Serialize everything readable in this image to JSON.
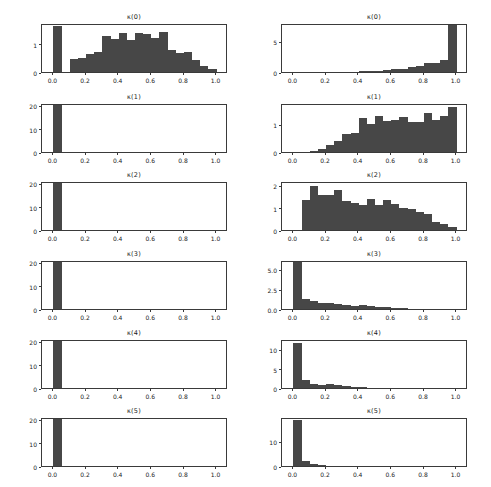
{
  "figure": {
    "background": "#ffffff",
    "bar_color": "#474747",
    "axis_color": "#3a3a3a",
    "rows": 6,
    "columns": 2
  },
  "chart_data": [
    {
      "type": "bar",
      "title": "κ(0)",
      "panel": "left-row-1",
      "xlabel": "",
      "ylabel": "",
      "xlim": [
        -0.07,
        1.07
      ],
      "ylim": [
        0,
        1.72
      ],
      "xticks": [
        0.0,
        0.2,
        0.4,
        0.6,
        0.8,
        1.0
      ],
      "xtick_labels": [
        "0.0",
        "0.2",
        "0.4",
        "0.6",
        "0.8",
        "1.0"
      ],
      "yticks": [
        0,
        1
      ],
      "ytick_labels": [
        "0",
        "1"
      ],
      "grid": false,
      "bin_edges": [
        0.0,
        0.05,
        0.1,
        0.15,
        0.2,
        0.25,
        0.3,
        0.35,
        0.4,
        0.45,
        0.5,
        0.55,
        0.6,
        0.65,
        0.7,
        0.75,
        0.8,
        0.85,
        0.9,
        0.95,
        1.0
      ],
      "values": [
        1.62,
        0.0,
        0.45,
        0.5,
        0.62,
        0.72,
        1.28,
        1.15,
        1.38,
        1.12,
        1.38,
        1.32,
        1.18,
        1.4,
        0.78,
        0.68,
        0.7,
        0.42,
        0.22,
        0.12
      ]
    },
    {
      "type": "bar",
      "title": "κ(1)",
      "panel": "left-row-2",
      "xlabel": "",
      "ylabel": "",
      "xlim": [
        -0.07,
        1.07
      ],
      "ylim": [
        0,
        21
      ],
      "xticks": [
        0.0,
        0.2,
        0.4,
        0.6,
        0.8,
        1.0
      ],
      "xtick_labels": [
        "0.0",
        "0.2",
        "0.4",
        "0.6",
        "0.8",
        "1.0"
      ],
      "yticks": [
        0,
        10,
        20
      ],
      "ytick_labels": [
        "0",
        "10",
        "20"
      ],
      "grid": false,
      "bin_edges": [
        0.0,
        0.05,
        0.1,
        0.15,
        0.2,
        0.25,
        0.3,
        0.35,
        0.4,
        0.45,
        0.5,
        0.55,
        0.6,
        0.65,
        0.7,
        0.75,
        0.8,
        0.85,
        0.9,
        0.95,
        1.0
      ],
      "values": [
        20.0,
        0,
        0,
        0,
        0,
        0,
        0,
        0,
        0,
        0,
        0,
        0,
        0,
        0,
        0,
        0,
        0,
        0,
        0,
        0
      ]
    },
    {
      "type": "bar",
      "title": "κ(2)",
      "panel": "left-row-3",
      "xlabel": "",
      "ylabel": "",
      "xlim": [
        -0.07,
        1.07
      ],
      "ylim": [
        0,
        21
      ],
      "xticks": [
        0.0,
        0.2,
        0.4,
        0.6,
        0.8,
        1.0
      ],
      "xtick_labels": [
        "0.0",
        "0.2",
        "0.4",
        "0.6",
        "0.8",
        "1.0"
      ],
      "yticks": [
        0,
        10,
        20
      ],
      "ytick_labels": [
        "0",
        "10",
        "20"
      ],
      "grid": false,
      "bin_edges": [
        0.0,
        0.05,
        0.1,
        0.15,
        0.2,
        0.25,
        0.3,
        0.35,
        0.4,
        0.45,
        0.5,
        0.55,
        0.6,
        0.65,
        0.7,
        0.75,
        0.8,
        0.85,
        0.9,
        0.95,
        1.0
      ],
      "values": [
        20.0,
        0,
        0,
        0,
        0,
        0,
        0,
        0,
        0,
        0,
        0,
        0,
        0,
        0,
        0,
        0,
        0,
        0,
        0,
        0
      ]
    },
    {
      "type": "bar",
      "title": "κ(3)",
      "panel": "left-row-4",
      "xlabel": "",
      "ylabel": "",
      "xlim": [
        -0.07,
        1.07
      ],
      "ylim": [
        0,
        21
      ],
      "xticks": [
        0.0,
        0.2,
        0.4,
        0.6,
        0.8,
        1.0
      ],
      "xtick_labels": [
        "0.0",
        "0.2",
        "0.4",
        "0.6",
        "0.8",
        "1.0"
      ],
      "yticks": [
        0,
        10,
        20
      ],
      "ytick_labels": [
        "0",
        "10",
        "20"
      ],
      "grid": false,
      "bin_edges": [
        0.0,
        0.05,
        0.1,
        0.15,
        0.2,
        0.25,
        0.3,
        0.35,
        0.4,
        0.45,
        0.5,
        0.55,
        0.6,
        0.65,
        0.7,
        0.75,
        0.8,
        0.85,
        0.9,
        0.95,
        1.0
      ],
      "values": [
        20.0,
        0,
        0,
        0,
        0,
        0,
        0,
        0,
        0,
        0,
        0,
        0,
        0,
        0,
        0,
        0,
        0,
        0,
        0,
        0
      ]
    },
    {
      "type": "bar",
      "title": "κ(4)",
      "panel": "left-row-5",
      "xlabel": "",
      "ylabel": "",
      "xlim": [
        -0.07,
        1.07
      ],
      "ylim": [
        0,
        21
      ],
      "xticks": [
        0.0,
        0.2,
        0.4,
        0.6,
        0.8,
        1.0
      ],
      "xtick_labels": [
        "0.0",
        "0.2",
        "0.4",
        "0.6",
        "0.8",
        "1.0"
      ],
      "yticks": [
        0,
        10,
        20
      ],
      "ytick_labels": [
        "0",
        "10",
        "20"
      ],
      "grid": false,
      "bin_edges": [
        0.0,
        0.05,
        0.1,
        0.15,
        0.2,
        0.25,
        0.3,
        0.35,
        0.4,
        0.45,
        0.5,
        0.55,
        0.6,
        0.65,
        0.7,
        0.75,
        0.8,
        0.85,
        0.9,
        0.95,
        1.0
      ],
      "values": [
        20.0,
        0,
        0,
        0,
        0,
        0,
        0,
        0,
        0,
        0,
        0,
        0,
        0,
        0,
        0,
        0,
        0,
        0,
        0,
        0
      ]
    },
    {
      "type": "bar",
      "title": "κ(5)",
      "panel": "left-row-6",
      "xlabel": "",
      "ylabel": "",
      "xlim": [
        -0.07,
        1.07
      ],
      "ylim": [
        0,
        21
      ],
      "xticks": [
        0.0,
        0.2,
        0.4,
        0.6,
        0.8,
        1.0
      ],
      "xtick_labels": [
        "0.0",
        "0.2",
        "0.4",
        "0.6",
        "0.8",
        "1.0"
      ],
      "yticks": [
        0,
        10,
        20
      ],
      "ytick_labels": [
        "0",
        "10",
        "20"
      ],
      "grid": false,
      "bin_edges": [
        0.0,
        0.05,
        0.1,
        0.15,
        0.2,
        0.25,
        0.3,
        0.35,
        0.4,
        0.45,
        0.5,
        0.55,
        0.6,
        0.65,
        0.7,
        0.75,
        0.8,
        0.85,
        0.9,
        0.95,
        1.0
      ],
      "values": [
        20.0,
        0,
        0,
        0,
        0,
        0,
        0,
        0,
        0,
        0,
        0,
        0,
        0,
        0,
        0,
        0,
        0,
        0,
        0,
        0
      ]
    },
    {
      "type": "bar",
      "title": "κ(0)",
      "panel": "right-row-1",
      "xlabel": "",
      "ylabel": "",
      "xlim": [
        -0.07,
        1.07
      ],
      "ylim": [
        0,
        8.0
      ],
      "xticks": [
        0.0,
        0.2,
        0.4,
        0.6,
        0.8,
        1.0
      ],
      "xtick_labels": [
        "0.0",
        "0.2",
        "0.4",
        "0.6",
        "0.8",
        "1.0"
      ],
      "yticks": [
        0,
        5
      ],
      "ytick_labels": [
        "0",
        "5"
      ],
      "grid": false,
      "bin_edges": [
        0.0,
        0.05,
        0.1,
        0.15,
        0.2,
        0.25,
        0.3,
        0.35,
        0.4,
        0.45,
        0.5,
        0.55,
        0.6,
        0.65,
        0.7,
        0.75,
        0.8,
        0.85,
        0.9,
        0.95,
        1.0
      ],
      "values": [
        0,
        0,
        0,
        0,
        0,
        0,
        0,
        0,
        0.1,
        0.14,
        0.22,
        0.3,
        0.42,
        0.55,
        0.75,
        0.95,
        1.55,
        1.48,
        1.92,
        7.6
      ]
    },
    {
      "type": "bar",
      "title": "κ(1)",
      "panel": "right-row-2",
      "xlabel": "",
      "ylabel": "",
      "xlim": [
        -0.07,
        1.07
      ],
      "ylim": [
        0,
        1.78
      ],
      "xticks": [
        0.0,
        0.2,
        0.4,
        0.6,
        0.8,
        1.0
      ],
      "xtick_labels": [
        "0.0",
        "0.2",
        "0.4",
        "0.6",
        "0.8",
        "1.0"
      ],
      "yticks": [
        0,
        1
      ],
      "ytick_labels": [
        "0",
        "1"
      ],
      "grid": false,
      "bin_edges": [
        0.0,
        0.05,
        0.1,
        0.15,
        0.2,
        0.25,
        0.3,
        0.35,
        0.4,
        0.45,
        0.5,
        0.55,
        0.6,
        0.65,
        0.7,
        0.75,
        0.8,
        0.85,
        0.9,
        0.95,
        1.0
      ],
      "values": [
        0,
        0,
        0.04,
        0.1,
        0.26,
        0.4,
        0.65,
        0.7,
        1.22,
        1.02,
        1.3,
        1.12,
        1.18,
        1.28,
        1.1,
        1.08,
        1.42,
        1.18,
        1.3,
        1.62
      ]
    },
    {
      "type": "bar",
      "title": "κ(2)",
      "panel": "right-row-3",
      "xlabel": "",
      "ylabel": "",
      "xlim": [
        -0.07,
        1.07
      ],
      "ylim": [
        0,
        2.18
      ],
      "xticks": [
        0.0,
        0.2,
        0.4,
        0.6,
        0.8,
        1.0
      ],
      "xtick_labels": [
        "0.0",
        "0.2",
        "0.4",
        "0.6",
        "0.8",
        "1.0"
      ],
      "yticks": [
        0,
        1,
        2
      ],
      "ytick_labels": [
        "0",
        "1",
        "2"
      ],
      "grid": false,
      "bin_edges": [
        0.0,
        0.05,
        0.1,
        0.15,
        0.2,
        0.25,
        0.3,
        0.35,
        0.4,
        0.45,
        0.5,
        0.55,
        0.6,
        0.65,
        0.7,
        0.75,
        0.8,
        0.85,
        0.9,
        0.95,
        1.0
      ],
      "values": [
        0,
        1.32,
        1.95,
        1.55,
        1.58,
        1.78,
        1.3,
        1.22,
        1.12,
        1.38,
        1.12,
        1.32,
        1.16,
        0.98,
        0.92,
        0.78,
        0.72,
        0.34,
        0.25,
        0.12
      ]
    },
    {
      "type": "bar",
      "title": "κ(3)",
      "panel": "right-row-4",
      "xlabel": "",
      "ylabel": "",
      "xlim": [
        -0.07,
        1.07
      ],
      "ylim": [
        0,
        6.2
      ],
      "xticks": [
        0.0,
        0.2,
        0.4,
        0.6,
        0.8,
        1.0
      ],
      "xtick_labels": [
        "0.0",
        "0.2",
        "0.4",
        "0.6",
        "0.8",
        "1.0"
      ],
      "yticks": [
        0.0,
        2.5,
        5.0
      ],
      "ytick_labels": [
        "0.0",
        "2.5",
        "5.0"
      ],
      "grid": false,
      "bin_edges": [
        0.0,
        0.05,
        0.1,
        0.15,
        0.2,
        0.25,
        0.3,
        0.35,
        0.4,
        0.45,
        0.5,
        0.55,
        0.6,
        0.65,
        0.7,
        0.75,
        0.8,
        0.85,
        0.9,
        0.95,
        1.0
      ],
      "values": [
        5.95,
        1.3,
        1.05,
        0.72,
        0.78,
        0.62,
        0.5,
        0.42,
        0.45,
        0.38,
        0.3,
        0.22,
        0.18,
        0.1,
        0.06,
        0.04,
        0.03,
        0.02,
        0.02,
        0.0
      ]
    },
    {
      "type": "bar",
      "title": "κ(4)",
      "panel": "right-row-5",
      "xlabel": "",
      "ylabel": "",
      "xlim": [
        -0.07,
        1.07
      ],
      "ylim": [
        0,
        12.6
      ],
      "xticks": [
        0.0,
        0.2,
        0.4,
        0.6,
        0.8,
        1.0
      ],
      "xtick_labels": [
        "0.0",
        "0.2",
        "0.4",
        "0.6",
        "0.8",
        "1.0"
      ],
      "yticks": [
        0,
        5,
        10
      ],
      "ytick_labels": [
        "0",
        "5",
        "10"
      ],
      "grid": false,
      "bin_edges": [
        0.0,
        0.05,
        0.1,
        0.15,
        0.2,
        0.25,
        0.3,
        0.35,
        0.4,
        0.45,
        0.5,
        0.55,
        0.6,
        0.65,
        0.7,
        0.75,
        0.8,
        0.85,
        0.9,
        0.95,
        1.0
      ],
      "values": [
        11.5,
        2.0,
        1.1,
        0.8,
        0.95,
        0.7,
        0.55,
        0.3,
        0.18,
        0.08,
        0.03,
        0.0,
        0.0,
        0.0,
        0.0,
        0.0,
        0.0,
        0.0,
        0.0,
        0.0
      ]
    },
    {
      "type": "bar",
      "title": "κ(5)",
      "panel": "right-row-6",
      "xlabel": "",
      "ylabel": "",
      "xlim": [
        -0.07,
        1.07
      ],
      "ylim": [
        0,
        19.5
      ],
      "xticks": [
        0.0,
        0.2,
        0.4,
        0.6,
        0.8,
        1.0
      ],
      "xtick_labels": [
        "0.0",
        "0.2",
        "0.4",
        "0.6",
        "0.8",
        "1.0"
      ],
      "yticks": [
        0,
        10
      ],
      "ytick_labels": [
        "0",
        "10"
      ],
      "grid": false,
      "bin_edges": [
        0.0,
        0.05,
        0.1,
        0.15,
        0.2,
        0.25,
        0.3,
        0.35,
        0.4,
        0.45,
        0.5,
        0.55,
        0.6,
        0.65,
        0.7,
        0.75,
        0.8,
        0.85,
        0.9,
        0.95,
        1.0
      ],
      "values": [
        18.2,
        2.1,
        1.0,
        0.35,
        0.12,
        0.05,
        0.0,
        0.0,
        0.0,
        0.0,
        0.0,
        0.0,
        0.0,
        0.0,
        0.0,
        0.0,
        0.0,
        0.0,
        0.0,
        0.0
      ]
    }
  ]
}
